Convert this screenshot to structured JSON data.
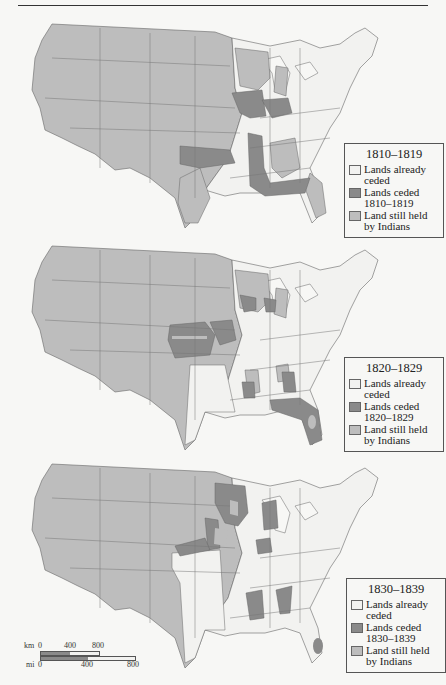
{
  "colors": {
    "already_ceded": "#f2f2f0",
    "ceded_in_period": "#8a8a8a",
    "still_held": "#bdbdbd",
    "border": "#666666",
    "lakes": "#f7f7f5"
  },
  "panels": [
    {
      "legend": {
        "title": "1810–1819",
        "items": [
          {
            "swatch": "already_ceded",
            "label": "Lands already\nceded"
          },
          {
            "swatch": "ceded_in_period",
            "label": "Lands ceded\n1810–1819"
          },
          {
            "swatch": "still_held",
            "label": "Land still held\nby Indians"
          }
        ]
      }
    },
    {
      "legend": {
        "title": "1820–1829",
        "items": [
          {
            "swatch": "already_ceded",
            "label": "Lands already\nceded"
          },
          {
            "swatch": "ceded_in_period",
            "label": "Lands ceded\n1820–1829"
          },
          {
            "swatch": "still_held",
            "label": "Land still held\nby Indians"
          }
        ]
      }
    },
    {
      "legend": {
        "title": "1830–1839",
        "items": [
          {
            "swatch": "already_ceded",
            "label": "Lands already\nceded"
          },
          {
            "swatch": "ceded_in_period",
            "label": "Lands ceded\n1830–1839"
          },
          {
            "swatch": "still_held",
            "label": "Land still held\nby Indians"
          }
        ]
      }
    }
  ],
  "scale_bar": {
    "km_label": "km",
    "mi_label": "mi",
    "km_ticks": [
      "0",
      "400",
      "800"
    ],
    "mi_ticks": [
      "0",
      "400",
      "800"
    ]
  }
}
